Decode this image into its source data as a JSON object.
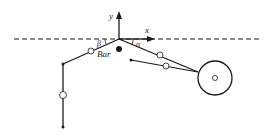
{
  "diagram": {
    "labels": {
      "y_axis": "y",
      "x_axis": "x",
      "angle_alpha": "α",
      "angle_beta": "β",
      "bar": "Bar"
    },
    "colors": {
      "stroke": "#1a1a1a",
      "background": "#ffffff"
    },
    "elements": [
      "dashed horizontal reference line",
      "coordinate axes at origin",
      "left arm link with joint marker",
      "vertical lower link with joint marker",
      "right upper link to wheel",
      "right lower link to wheel",
      "wheel with center hub",
      "bar mass point"
    ]
  }
}
